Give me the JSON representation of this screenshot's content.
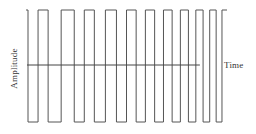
{
  "figure": {
    "background_color": "#ffffff",
    "stroke_color": "#555555",
    "axis_color": "#444444",
    "label_color": "#333333"
  },
  "labels": {
    "y_axis": "Amplitude",
    "x_axis": "Time"
  },
  "chart_data": {
    "type": "line",
    "title": "",
    "xlabel": "Time",
    "ylabel": "Amplitude",
    "subtitle": "",
    "grid": false,
    "legend": null,
    "annotations": [],
    "xlim": [
      0,
      1
    ],
    "ylim": [
      -1,
      1
    ],
    "x_tick_labels": [],
    "y_tick_labels": [],
    "series": [
      {
        "name": "square-wave-chirp",
        "waveform": "square",
        "amplitude": 1,
        "levels": [
          1,
          -1
        ],
        "start_level": 1,
        "edges_x": [
          0.01,
          0.06,
          0.11,
          0.175,
          0.24,
          0.29,
          0.34,
          0.395,
          0.45,
          0.5,
          0.548,
          0.594,
          0.64,
          0.684,
          0.727,
          0.768,
          0.808,
          0.845,
          0.881,
          0.914,
          0.946,
          0.975
        ],
        "x": [
          0.01,
          0.06,
          0.11,
          0.175,
          0.24,
          0.29,
          0.34,
          0.395,
          0.45,
          0.5,
          0.548,
          0.594,
          0.64,
          0.684,
          0.727,
          0.768,
          0.808,
          0.845,
          0.881,
          0.914,
          0.946,
          0.975
        ],
        "values": [
          1,
          -1,
          1,
          -1,
          1,
          -1,
          1,
          -1,
          1,
          -1,
          1,
          -1,
          1,
          -1,
          1,
          -1,
          1,
          -1,
          1,
          -1,
          1,
          -1
        ],
        "half_periods": [
          0.05,
          0.05,
          0.065,
          0.065,
          0.05,
          0.05,
          0.055,
          0.055,
          0.05,
          0.048,
          0.046,
          0.046,
          0.044,
          0.043,
          0.041,
          0.04,
          0.037,
          0.036,
          0.033,
          0.032,
          0.029
        ]
      }
    ],
    "zero_axis": {
      "y": 0,
      "x_start": 0.005,
      "x_end": 0.865,
      "visible": true
    }
  }
}
